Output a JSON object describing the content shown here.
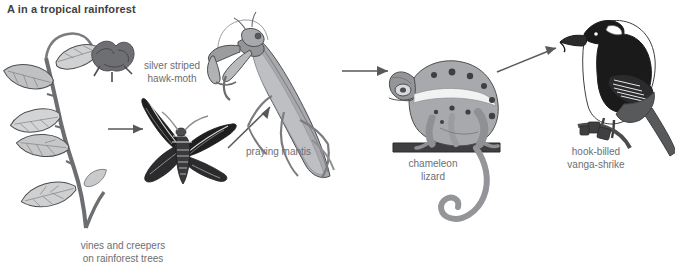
{
  "title": "A in a tropical rainforest",
  "colors": {
    "title_text": "#3f3f41",
    "label_text": "#6d6e71",
    "arrow": "#58595b",
    "outline": "#4d4d4f",
    "light_grey": "#d6d7d8",
    "mid_grey": "#a7a9ac",
    "dark_grey": "#808285",
    "deep_grey": "#58595b",
    "black": "#1a1a1a",
    "white": "#ffffff",
    "background": "#ffffff"
  },
  "labels": {
    "vine": "vines and creepers\non rainforest trees",
    "moth": "silver striped\nhawk-moth",
    "mantis": "praying mantis",
    "chameleon": "chameleon\nlizard",
    "bird": "hook-billed\nvanga-shrike"
  },
  "organisms": [
    {
      "id": "vine",
      "name": "vines and creepers on rainforest trees",
      "role": "producer",
      "trophic_level": 1
    },
    {
      "id": "moth",
      "name": "silver striped hawk-moth",
      "role": "primary consumer",
      "trophic_level": 2
    },
    {
      "id": "mantis",
      "name": "praying mantis",
      "role": "secondary consumer",
      "trophic_level": 3
    },
    {
      "id": "chameleon",
      "name": "chameleon lizard",
      "role": "tertiary consumer",
      "trophic_level": 4
    },
    {
      "id": "bird",
      "name": "hook-billed vanga-shrike",
      "role": "quaternary consumer",
      "trophic_level": 5
    }
  ],
  "arrows": [
    {
      "from": "vine",
      "to": "moth",
      "direction": "horizontal-right"
    },
    {
      "from": "moth",
      "to": "mantis",
      "direction": "diagonal-up-right"
    },
    {
      "from": "mantis",
      "to": "chameleon",
      "direction": "horizontal-right"
    },
    {
      "from": "chameleon",
      "to": "bird",
      "direction": "diagonal-up-right"
    }
  ]
}
